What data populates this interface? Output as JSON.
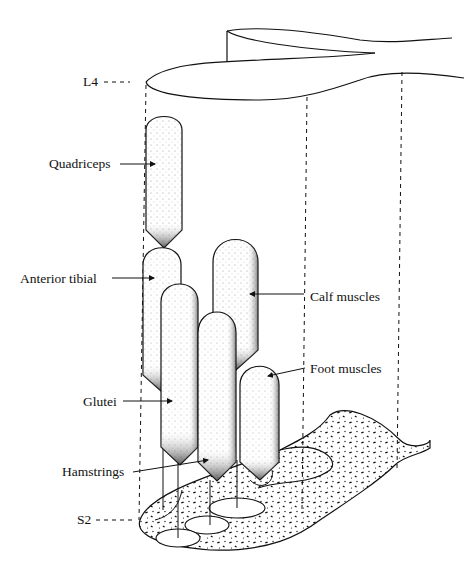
{
  "diagram": {
    "type": "anatomical-illustration",
    "level_labels": {
      "top": "L4",
      "bottom": "S2"
    },
    "muscle_labels": [
      {
        "id": "quadriceps",
        "text": "Quadriceps"
      },
      {
        "id": "anterior-tibial",
        "text": "Anterior tibial"
      },
      {
        "id": "calf-muscles",
        "text": "Calf muscles"
      },
      {
        "id": "foot-muscles",
        "text": "Foot muscles"
      },
      {
        "id": "glutei",
        "text": "Glutei"
      },
      {
        "id": "hamstrings",
        "text": "Hamstrings"
      }
    ],
    "colors": {
      "ink": "#111111",
      "background": "#ffffff"
    }
  }
}
